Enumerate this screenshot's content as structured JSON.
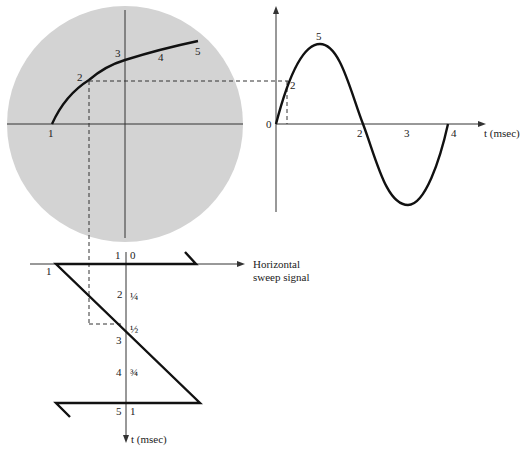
{
  "scope": {
    "curve_points": [
      "1",
      "2",
      "3",
      "4",
      "5"
    ],
    "screen_color": "#d3d3d3"
  },
  "sine_plot": {
    "origin_label": "0",
    "peak_label": "5",
    "point2_label": "2",
    "tick_labels": [
      "2",
      "3",
      "4"
    ],
    "axis_label": "t (msec)"
  },
  "sweep_plot": {
    "horizontal_axis_label_line1": "Horizontal",
    "horizontal_axis_label_line2": "sweep signal",
    "vertical_axis_label": "t (msec)",
    "left_labels": [
      "1",
      "1",
      "2",
      "3",
      "4",
      "5"
    ],
    "right_labels": [
      "0",
      "¼",
      "½",
      "¾",
      "1"
    ]
  }
}
